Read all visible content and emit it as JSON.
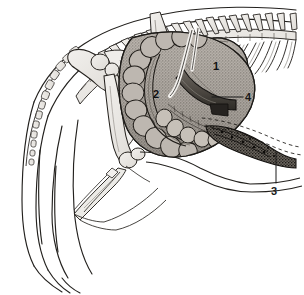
{
  "figure": {
    "view": "lateral (left side), cranial to the right",
    "style": "black-and-white stippled line engraving",
    "background_color": "#ffffff",
    "ink_color": "#1a1a1a",
    "bone_fill_color": "#eceae6",
    "organ_shade_color": "#8f8b86",
    "dark_organ_color": "#4a4641",
    "width_px": 304,
    "height_px": 295
  },
  "labels": [
    {
      "id": "label-1",
      "text": "1",
      "x": 213,
      "y": 61,
      "placement": "on-organ",
      "leader": false,
      "refers_to": "stomach"
    },
    {
      "id": "label-2",
      "text": "2",
      "x": 153,
      "y": 89,
      "placement": "on-organ",
      "leader": false,
      "refers_to": "sacculated colon / caecum coil"
    },
    {
      "id": "label-3",
      "text": "3",
      "x": 271,
      "y": 186,
      "placement": "outside",
      "leader": true,
      "leader_from_x": 276,
      "leader_from_y": 183,
      "leader_to_x": 276,
      "leader_to_y": 152,
      "refers_to": "rectum"
    },
    {
      "id": "label-4",
      "text": "4",
      "x": 245,
      "y": 92,
      "placement": "outside",
      "leader": true,
      "leader_from_x": 243,
      "leader_from_y": 97,
      "leader_to_x": 212,
      "leader_to_y": 97,
      "refers_to": "duodenum / small intestine loop"
    }
  ],
  "structures": [
    {
      "name": "vertebral-column",
      "description": "thoracic and lumbar vertebrae with dorsal spinous processes running along the top"
    },
    {
      "name": "ribcage",
      "description": "series of ribs slanting down and forward from the right portion of the spine"
    },
    {
      "name": "cervical-vertebrae",
      "description": "beaded chain of small vertebrae curving down the left neck contour"
    },
    {
      "name": "scapula",
      "description": "pale shoulder blade plate behind the humerus head"
    },
    {
      "name": "humerus",
      "description": "upper forelimb bone"
    },
    {
      "name": "radius-ulna",
      "description": "lower forelimb bones descending to the carpus"
    },
    {
      "name": "carpus-metacarpus",
      "description": "wrist and foot bones pointing down-left"
    },
    {
      "name": "stomach",
      "description": "rounded shaded sac at upper right, marked 1"
    },
    {
      "name": "colon-coil",
      "description": "large sacculated coiled gut filling the abdomen, marked 2"
    },
    {
      "name": "duodenum",
      "description": "dark tubular loop emerging below the stomach, marked 4"
    },
    {
      "name": "rectum",
      "description": "dark granular terminal gut at lower right, marked 3"
    },
    {
      "name": "body-contour",
      "description": "outline of the neck, chest, belly and rump"
    }
  ]
}
